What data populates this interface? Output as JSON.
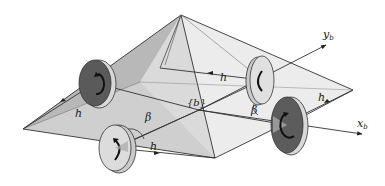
{
  "diagram": {
    "labels": {
      "arm_length": "h",
      "tilt_angle": "β",
      "body_frame": "{b}",
      "x_axis_main": "x",
      "x_axis_sub": "b",
      "y_axis_main": "y",
      "y_axis_sub": "b"
    },
    "rotors": [
      {
        "name": "rotor-left",
        "shade": "dark",
        "spin": "counterclockwise"
      },
      {
        "name": "rotor-front",
        "shade": "light",
        "spin": "clockwise"
      },
      {
        "name": "rotor-back",
        "shade": "light",
        "spin": "clockwise"
      },
      {
        "name": "rotor-right",
        "shade": "dark",
        "spin": "counterclockwise"
      }
    ],
    "colors": {
      "dark_rotor": "#5a5a5a",
      "light_rotor": "#d6d6d6",
      "pyramid_face_dark": "#bdbdbd",
      "pyramid_face_mid": "#d4d4d4",
      "pyramid_face_light": "#e6e6e6",
      "line": "#333333"
    }
  }
}
